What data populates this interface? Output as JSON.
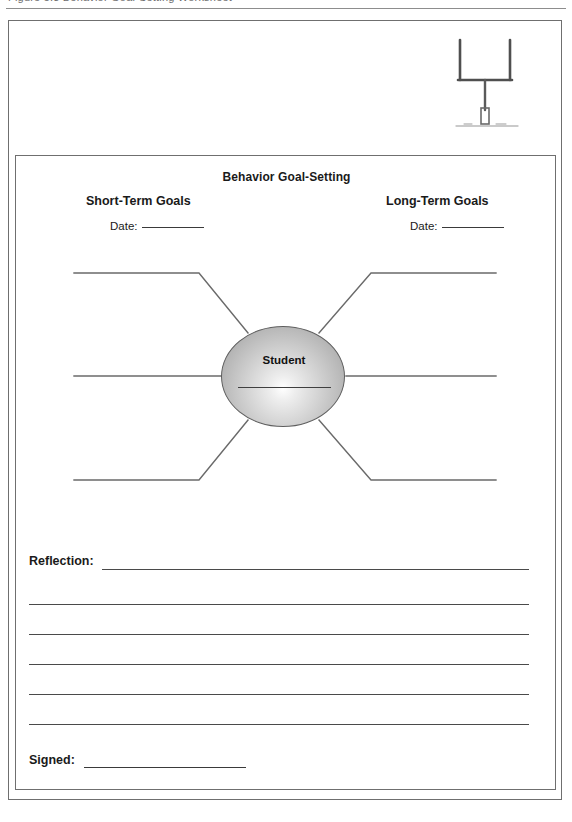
{
  "document": {
    "header_text": "Figure 5.3  Behavior Goal-Setting Worksheet",
    "title": "Behavior Goal-Setting",
    "columns": {
      "short_term": "Short-Term Goals",
      "long_term": "Long-Term Goals"
    },
    "date_label": "Date:",
    "center_label": "Student",
    "reflection_label": "Reflection:",
    "signed_label": "Signed:",
    "illustration": "football-goal-post"
  },
  "layout": {
    "reflection_line_count": 5,
    "spokes_per_side": 3
  },
  "colors": {
    "ink": "#1a1a1a",
    "rule": "#4a4a4a",
    "border": "#6f6f6f",
    "bubble_edge": "#5e5e5e"
  }
}
